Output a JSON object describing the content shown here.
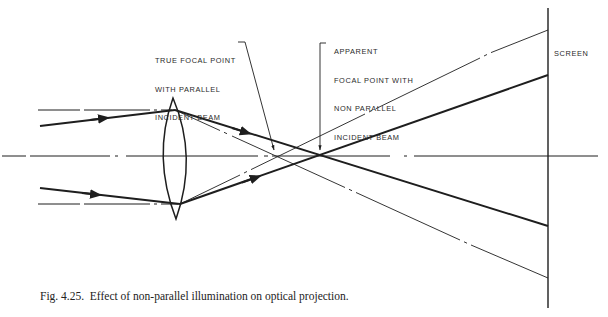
{
  "labels": {
    "true_focal": [
      "TRUE FOCAL POINT",
      "WITH PARALLEL",
      "INCIDENT BEAM"
    ],
    "apparent_focal": [
      "APPARENT",
      "FOCAL POINT WITH",
      "NON PARALLEL",
      "INCIDENT BEAM"
    ],
    "screen": "SCREEN"
  },
  "caption": "Fig. 4.25.  Effect of non-parallel illumination on optical projection.",
  "colors": {
    "ink": "#1e1e1e",
    "background": "#ffffff"
  },
  "geometry": {
    "optical_axis_y": 156,
    "lens_center_x": 175,
    "screen_x": 548,
    "true_focal_point": [
      276,
      156
    ],
    "apparent_focal_point": [
      290,
      154
    ]
  }
}
